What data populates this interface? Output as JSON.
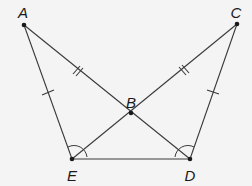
{
  "diagram": {
    "type": "geometry-figure",
    "points": {
      "A": {
        "label": "A",
        "x": 24,
        "y": 25,
        "label_x": 23,
        "label_y": 12
      },
      "B": {
        "label": "B",
        "x": 131,
        "y": 113,
        "label_x": 131,
        "label_y": 102
      },
      "C": {
        "label": "C",
        "x": 237,
        "y": 24,
        "label_x": 236,
        "label_y": 12
      },
      "D": {
        "label": "D",
        "x": 190,
        "y": 159,
        "label_x": 190,
        "label_y": 175
      },
      "E": {
        "label": "E",
        "x": 72,
        "y": 159,
        "label_x": 72,
        "label_y": 175
      }
    },
    "segments": [
      "AE",
      "AD",
      "CE",
      "CD",
      "ED"
    ],
    "congruence_marks": {
      "single_tick": [
        "AE",
        "CD"
      ],
      "double_tick": [
        "AB",
        "CB"
      ]
    },
    "angle_marks": [
      "AED",
      "CDE"
    ],
    "colors": {
      "background": "#f4f4f4",
      "stroke": "#3a3a3a",
      "text": "#1a1a1a"
    }
  }
}
